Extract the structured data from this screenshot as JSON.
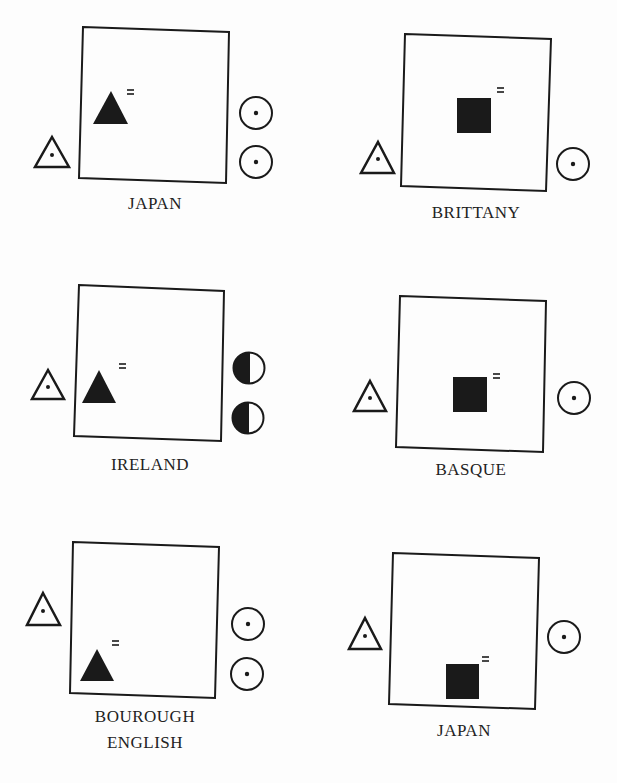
{
  "diagram": {
    "colors": {
      "ink": "#1a1a1a",
      "background": "#fdfdfd"
    },
    "panels": [
      {
        "id": 1,
        "label": "JAPAN",
        "heir_symbol": "filled-triangle",
        "heir_position": "middle-left",
        "left_symbol": "dotted-triangle",
        "right_symbols": [
          "dotted-circle",
          "dotted-circle"
        ]
      },
      {
        "id": 2,
        "label": "BRITTANY",
        "heir_symbol": "filled-square",
        "heir_position": "center",
        "left_symbol": "dotted-triangle",
        "right_symbols": [
          "dotted-circle"
        ]
      },
      {
        "id": 3,
        "label": "IRELAND",
        "heir_symbol": "filled-triangle",
        "heir_position": "lower-left",
        "left_symbol": "dotted-triangle",
        "right_symbols": [
          "half-filled-circle",
          "half-filled-circle"
        ]
      },
      {
        "id": 4,
        "label": "BASQUE",
        "heir_symbol": "filled-square",
        "heir_position": "lower-center",
        "left_symbol": "dotted-triangle",
        "right_symbols": [
          "dotted-circle"
        ]
      },
      {
        "id": 5,
        "label_lines": [
          "BOUROUGH",
          "ENGLISH"
        ],
        "heir_symbol": "filled-triangle",
        "heir_position": "bottom-left",
        "left_symbol": "dotted-triangle",
        "right_symbols": [
          "dotted-circle",
          "dotted-circle"
        ]
      },
      {
        "id": 6,
        "label": "JAPAN",
        "heir_symbol": "filled-square",
        "heir_position": "bottom-center",
        "left_symbol": "dotted-triangle",
        "right_symbols": [
          "dotted-circle"
        ]
      }
    ],
    "equals_mark": "="
  }
}
